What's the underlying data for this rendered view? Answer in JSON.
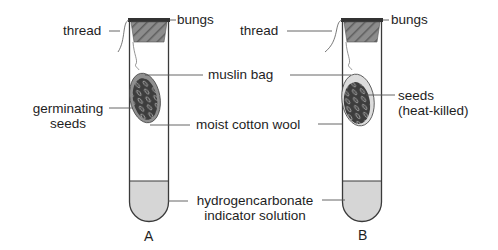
{
  "colors": {
    "line": "#3a3a3a",
    "liquid": "#d6d6d6",
    "bung_fill": "#8a8a8a",
    "bung_top": "#333333",
    "seeds": "#3f3f3f",
    "text": "#1e1e1e"
  },
  "labels": {
    "thread_a": "thread",
    "bungs_a": "bungs",
    "thread_b": "thread",
    "bungs_b": "bungs",
    "muslin_bag": "muslin bag",
    "germinating_seeds_line1": "germinating",
    "germinating_seeds_line2": "seeds",
    "moist_cotton_wool": "moist cotton wool",
    "seeds_b_line1": "seeds",
    "seeds_b_line2": "(heat-killed)",
    "indicator_line1": "hydrogencarbonate",
    "indicator_line2": "indicator  solution"
  },
  "tubes": [
    {
      "id": "A",
      "label": "A",
      "contents": "germinating seeds"
    },
    {
      "id": "B",
      "label": "B",
      "contents": "seeds (heat-killed)"
    }
  ]
}
